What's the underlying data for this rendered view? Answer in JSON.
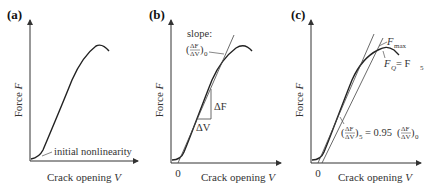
{
  "panels": [
    {
      "id": "a",
      "label": "(a)",
      "ylabel": "Force F",
      "xlabel": "Crack opening V",
      "annotations": [
        "initial nonlinearity"
      ]
    },
    {
      "id": "b",
      "label": "(b)",
      "ylabel": "Force F",
      "xlabel": "Crack opening V",
      "origin_tick": "0",
      "annotations": [
        "slope:",
        "(ΔF/ΔV)0",
        "ΔF",
        "ΔV"
      ]
    },
    {
      "id": "c",
      "label": "(c)",
      "ylabel": "Force F",
      "xlabel": "Crack opening V",
      "origin_tick": "0",
      "annotations": [
        "Fmax",
        "FQ = F5",
        "(ΔF/ΔV)5 = 0.95 (ΔF/ΔV)0"
      ]
    }
  ],
  "text": {
    "a_label": "(a)",
    "b_label": "(b)",
    "c_label": "(c)",
    "force": "Force ",
    "F": "F",
    "crack": "Crack opening ",
    "V": "V",
    "zero": "0",
    "initial": "initial nonlinearity",
    "slope": "slope:",
    "dF": "ΔF",
    "dV": "ΔV",
    "max": "max",
    "Q": "Q",
    "eq": " = F",
    "five": "5",
    "zero_sub": "0",
    "coef": "= 0.95"
  }
}
